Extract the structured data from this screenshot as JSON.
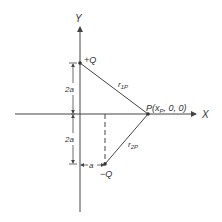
{
  "axes": {
    "x_label": "X",
    "y_label": "Y"
  },
  "charges": {
    "positive": "+Q",
    "negative": "−Q"
  },
  "point": {
    "label": "P(x",
    "sub": "P",
    "rest": ", 0, 0)"
  },
  "distances": {
    "r1": "r",
    "r1_sub": "1P",
    "r2": "r",
    "r2_sub": "2P"
  },
  "dimensions": {
    "upper": "2a",
    "lower": "2a",
    "horizontal": "a"
  },
  "colors": {
    "line": "#444444",
    "text": "#333333"
  }
}
